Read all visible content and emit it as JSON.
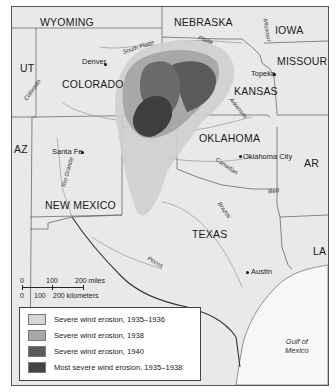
{
  "map": {
    "states": [
      {
        "name": "WYOMING",
        "x": 28,
        "y": 9
      },
      {
        "name": "NEBRASKA",
        "x": 162,
        "y": 9
      },
      {
        "name": "IOWA",
        "x": 263,
        "y": 17
      },
      {
        "name": "UT",
        "x": 8,
        "y": 55
      },
      {
        "name": "COLORADO",
        "x": 50,
        "y": 71
      },
      {
        "name": "MISSOURI",
        "x": 265,
        "y": 48
      },
      {
        "name": "KANSAS",
        "x": 222,
        "y": 78
      },
      {
        "name": "AZ",
        "x": 2,
        "y": 136
      },
      {
        "name": "OKLAHOMA",
        "x": 187,
        "y": 125
      },
      {
        "name": "AR",
        "x": 292,
        "y": 150
      },
      {
        "name": "NEW MEXICO",
        "x": 33,
        "y": 192
      },
      {
        "name": "TEXAS",
        "x": 180,
        "y": 221
      },
      {
        "name": "LA",
        "x": 301,
        "y": 238
      }
    ],
    "cities": [
      {
        "name": "Denver",
        "x": 70,
        "y": 50,
        "dot_x": 93,
        "dot_y": 57
      },
      {
        "name": "Topeka",
        "x": 240,
        "y": 62,
        "dot_x": 262,
        "dot_y": 67
      },
      {
        "name": "Santa Fe",
        "x": 40,
        "y": 140,
        "dot_x": 70,
        "dot_y": 145
      },
      {
        "name": "Oklahoma City",
        "x": 231,
        "y": 145,
        "dot_x": 228,
        "dot_y": 149
      },
      {
        "name": "Austin",
        "x": 239,
        "y": 260,
        "dot_x": 235,
        "dot_y": 265
      }
    ],
    "rivers": [
      {
        "name": "South Platte",
        "x": 110,
        "y": 37,
        "rotate": -18
      },
      {
        "name": "Platte",
        "x": 186,
        "y": 30,
        "rotate": 20
      },
      {
        "name": "Missouri",
        "x": 255,
        "y": 12,
        "rotate": 80
      },
      {
        "name": "Colorado",
        "x": 15,
        "y": 80,
        "rotate": -55
      },
      {
        "name": "Arkansas",
        "x": 218,
        "y": 98,
        "rotate": 50
      },
      {
        "name": "Rio Grande",
        "x": 50,
        "y": 160,
        "rotate": -75
      },
      {
        "name": "Canadian",
        "x": 205,
        "y": 156,
        "rotate": 35
      },
      {
        "name": "Red",
        "x": 256,
        "y": 181,
        "rotate": -10
      },
      {
        "name": "Brazos",
        "x": 205,
        "y": 200,
        "rotate": 55
      },
      {
        "name": "Pecos",
        "x": 135,
        "y": 250,
        "rotate": 30
      }
    ],
    "gulf": {
      "line1": "Gulf of",
      "line2": "Mexico"
    }
  },
  "scale_bar": {
    "miles_ticks": [
      "0",
      "100",
      "200 miles"
    ],
    "km_ticks": [
      "0",
      "100",
      "200 kilometers"
    ]
  },
  "legend": {
    "items": [
      {
        "label": "Severe wind erosion, 1935–1936",
        "color": "#cfcfcf"
      },
      {
        "label": "Severe wind erosion, 1938",
        "color": "#a8a8a8"
      },
      {
        "label": "Severe wind erosion, 1940",
        "color": "#5a5a5a"
      },
      {
        "label": "Most severe wind erosion, 1935–1938",
        "color": "#444444"
      }
    ]
  },
  "colors": {
    "land": "#e9e9e9",
    "gulf": "#f7f7f7",
    "border": "#555555"
  }
}
